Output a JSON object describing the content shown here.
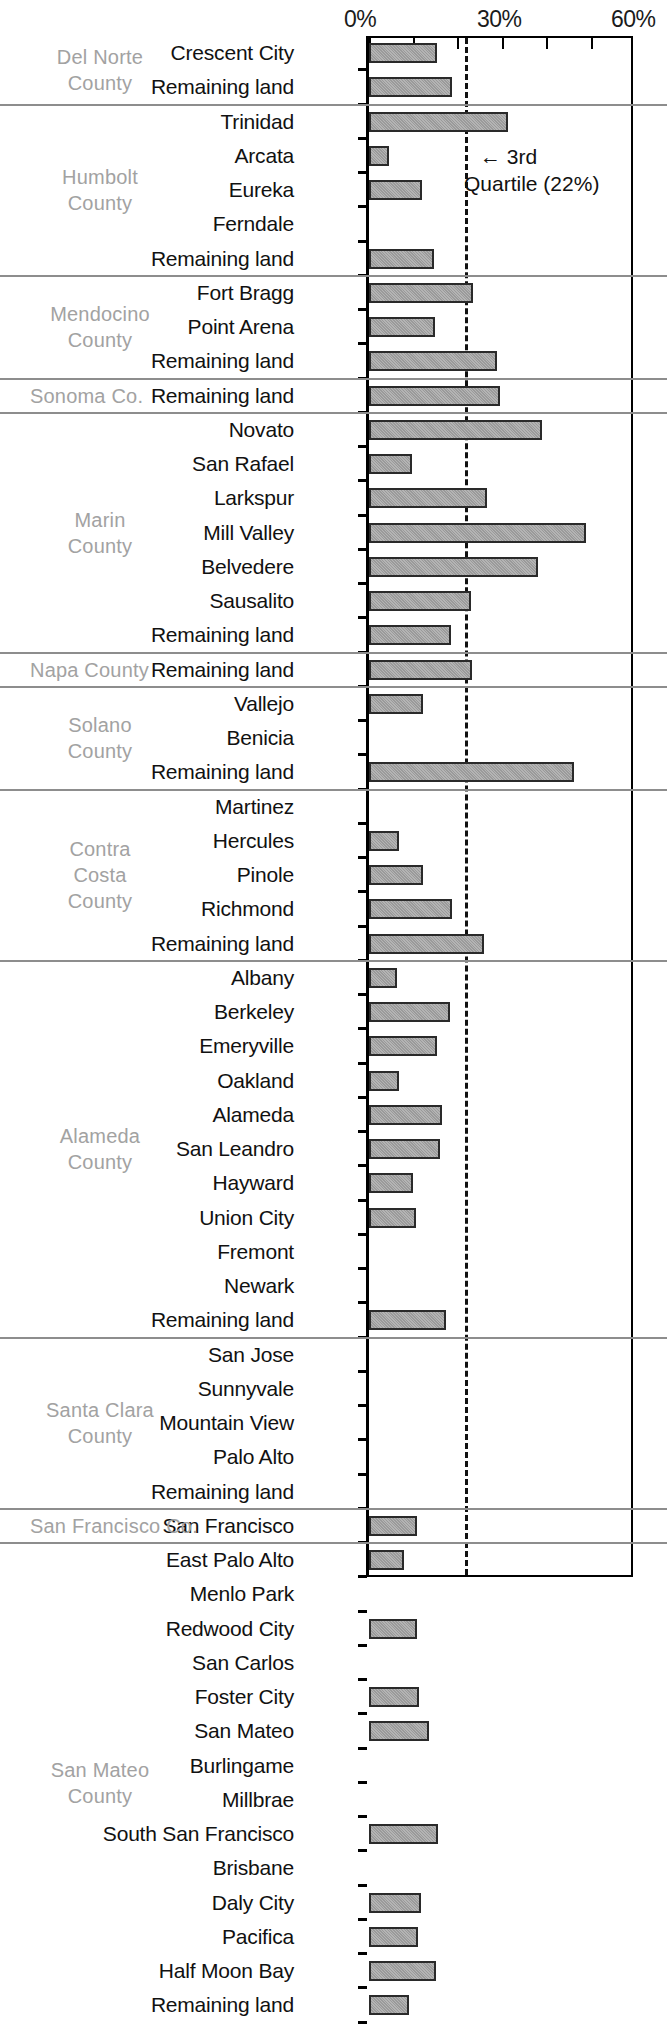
{
  "chart": {
    "type": "bar",
    "orientation": "horizontal",
    "axis": {
      "ticks_labeled": [
        "0%",
        "30%",
        "60%"
      ],
      "min": 0,
      "max": 60,
      "unit": "%",
      "minor_tick_step": 10
    },
    "annotation": {
      "line1": "← 3rd",
      "line2": "Quartile (22%)",
      "value": 22
    },
    "colors": {
      "bar_fill": "#a8a8a8",
      "bar_border": "#2a2a2a",
      "group_rule": "#8d8d8d",
      "group_label": "#a2a2a2",
      "quartile_line": "#111111"
    }
  },
  "chart_data": {
    "type": "bar",
    "title": "",
    "xlabel": "",
    "ylabel": "",
    "xlim": [
      0,
      60
    ],
    "grid": false,
    "legend": null,
    "annotations": [
      {
        "text": "← 3rd Quartile (22%)",
        "x": 22
      }
    ],
    "groups": [
      {
        "county": "Del Norte\nCounty",
        "county_lines": [
          "Del Norte",
          "County"
        ],
        "categories": [
          "Crescent City",
          "Remaining land"
        ],
        "values": [
          15.3,
          18.7
        ]
      },
      {
        "county": "Humbolt\nCounty",
        "county_lines": [
          "Humbolt",
          "County"
        ],
        "categories": [
          "Trinidad",
          "Arcata",
          "Eureka",
          "Ferndale",
          "Remaining land"
        ],
        "values": [
          31.2,
          4.5,
          11.9,
          0,
          14.6
        ]
      },
      {
        "county": "Mendocino\nCounty",
        "county_lines": [
          "Mendocino",
          "County"
        ],
        "categories": [
          "Fort Bragg",
          "Point Arena",
          "Remaining land"
        ],
        "values": [
          23.4,
          14.8,
          28.8
        ]
      },
      {
        "county": "Sonoma Co.",
        "county_lines": [
          "Sonoma Co."
        ],
        "categories": [
          "Remaining land"
        ],
        "values": [
          29.4
        ]
      },
      {
        "county": "Marin\nCounty",
        "county_lines": [
          "Marin",
          "County"
        ],
        "categories": [
          "Novato",
          "San Rafael",
          "Larkspur",
          "Mill Valley",
          "Belvedere",
          "Sausalito",
          "Remaining land"
        ],
        "values": [
          38.9,
          9.6,
          26.5,
          48.8,
          38.0,
          22.9,
          18.4
        ]
      },
      {
        "county": "Napa County",
        "county_lines": [
          "Napa County"
        ],
        "categories": [
          "Remaining land"
        ],
        "values": [
          23.1
        ]
      },
      {
        "county": "Solano\nCounty",
        "county_lines": [
          "Solano",
          "County"
        ],
        "categories": [
          "Vallejo",
          "Benicia",
          "Remaining land"
        ],
        "values": [
          12.2,
          0,
          46.0
        ]
      },
      {
        "county": "Contra\nCosta\nCounty",
        "county_lines": [
          "Contra",
          "Costa",
          "County"
        ],
        "categories": [
          "Martinez",
          "Hercules",
          "Pinole",
          "Richmond",
          "Remaining land"
        ],
        "values": [
          0,
          6.7,
          12.2,
          18.7,
          25.8
        ]
      },
      {
        "county": "Alameda\nCounty",
        "county_lines": [
          "Alameda",
          "County"
        ],
        "categories": [
          "Albany",
          "Berkeley",
          "Emeryville",
          "Oakland",
          "Alameda",
          "San Leandro",
          "Hayward",
          "Union City",
          "Fremont",
          "Newark",
          "Remaining land"
        ],
        "values": [
          6.3,
          18.2,
          15.3,
          6.7,
          16.4,
          15.9,
          9.9,
          10.5,
          0,
          0,
          17.3
        ]
      },
      {
        "county": "Santa Clara\nCounty",
        "county_lines": [
          "Santa Clara",
          "County"
        ],
        "categories": [
          "San Jose",
          "Sunnyvale",
          "Mountain View",
          "Palo Alto",
          "Remaining land"
        ],
        "values": [
          0,
          0,
          0,
          0,
          0
        ]
      },
      {
        "county": "San Francisco Co.",
        "county_lines": [
          "San Francisco Co."
        ],
        "categories": [
          "San Francisco"
        ],
        "values": [
          10.8
        ]
      },
      {
        "county": "San Mateo\nCounty",
        "county_lines": [
          "San Mateo",
          "County"
        ],
        "categories": [
          "East Palo Alto",
          "Menlo Park",
          "Redwood City",
          "San Carlos",
          "Foster City",
          "San Mateo",
          "Burlingame",
          "Millbrae",
          "South San Francisco",
          "Brisbane",
          "Daly City",
          "Pacifica",
          "Half Moon Bay",
          "Remaining land"
        ],
        "values": [
          7.9,
          0,
          10.8,
          0,
          11.2,
          13.5,
          0,
          0,
          15.5,
          0,
          11.7,
          11.0,
          15.1,
          9.0
        ]
      }
    ]
  }
}
